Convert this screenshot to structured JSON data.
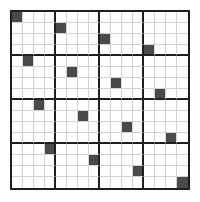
{
  "puzzle": {
    "size": 16,
    "block_size": 4,
    "colors": {
      "filled": "#4a4a4a",
      "empty": "#ffffff",
      "thin_line": "#d2d2d2",
      "thick_line": "#1e1e1e"
    },
    "filled_cells": [
      {
        "row": 0,
        "col": 0
      },
      {
        "row": 1,
        "col": 4
      },
      {
        "row": 2,
        "col": 8
      },
      {
        "row": 3,
        "col": 12
      },
      {
        "row": 4,
        "col": 1
      },
      {
        "row": 5,
        "col": 5
      },
      {
        "row": 6,
        "col": 9
      },
      {
        "row": 7,
        "col": 13
      },
      {
        "row": 8,
        "col": 2
      },
      {
        "row": 9,
        "col": 6
      },
      {
        "row": 10,
        "col": 10
      },
      {
        "row": 11,
        "col": 14
      },
      {
        "row": 12,
        "col": 3
      },
      {
        "row": 13,
        "col": 7
      },
      {
        "row": 14,
        "col": 11
      },
      {
        "row": 15,
        "col": 15
      }
    ]
  }
}
